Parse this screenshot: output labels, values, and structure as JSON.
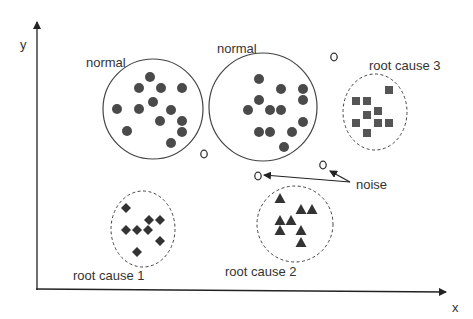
{
  "axes": {
    "x_label": "x",
    "y_label": "y",
    "color": "#222222"
  },
  "colors": {
    "point": "#4a4a4a",
    "outline": "#444444",
    "text": "#333333"
  },
  "clusters": [
    {
      "label": "normal",
      "shape": "circle",
      "boundary": "solid",
      "center": [
        153,
        109
      ],
      "r": [
        50,
        50
      ],
      "label_pos": [
        86,
        61
      ],
      "points": [
        [
          150,
          77
        ],
        [
          139,
          88
        ],
        [
          161,
          88
        ],
        [
          182,
          88
        ],
        [
          117,
          109
        ],
        [
          139,
          109
        ],
        [
          153,
          102
        ],
        [
          171,
          110
        ],
        [
          160,
          121
        ],
        [
          182,
          121
        ],
        [
          182,
          132
        ],
        [
          127,
          131
        ],
        [
          171,
          143
        ]
      ]
    },
    {
      "label": "normal",
      "shape": "circle",
      "boundary": "solid",
      "center": [
        263,
        107
      ],
      "r": [
        54,
        54
      ],
      "label_pos": [
        217,
        47
      ],
      "points": [
        [
          259,
          79
        ],
        [
          281,
          89
        ],
        [
          303,
          89
        ],
        [
          259,
          100
        ],
        [
          303,
          100
        ],
        [
          248,
          110
        ],
        [
          270,
          110
        ],
        [
          281,
          110
        ],
        [
          303,
          122
        ],
        [
          259,
          132
        ],
        [
          270,
          132
        ],
        [
          292,
          132
        ],
        [
          284,
          147
        ]
      ]
    },
    {
      "label": "root cause 3",
      "shape": "square",
      "boundary": "dashed",
      "center": [
        375,
        112
      ],
      "r": [
        32,
        38
      ],
      "label_pos": [
        369,
        58
      ],
      "points": [
        [
          389,
          90
        ],
        [
          356,
          101
        ],
        [
          367,
          101
        ],
        [
          367,
          115
        ],
        [
          378,
          111
        ],
        [
          356,
          123
        ],
        [
          378,
          123
        ],
        [
          389,
          123
        ],
        [
          367,
          133
        ]
      ]
    },
    {
      "label": "root cause 1",
      "shape": "diamond",
      "boundary": "dashed",
      "center": [
        143,
        229
      ],
      "r": [
        32,
        38
      ],
      "label_pos": [
        73,
        268
      ],
      "points": [
        [
          126,
          208
        ],
        [
          149,
          220
        ],
        [
          160,
          220
        ],
        [
          126,
          230
        ],
        [
          137,
          230
        ],
        [
          148,
          230
        ],
        [
          160,
          241
        ],
        [
          137,
          252
        ]
      ]
    },
    {
      "label": "root cause 2",
      "shape": "triangle",
      "boundary": "dashed",
      "center": [
        295,
        224
      ],
      "r": [
        38,
        38
      ],
      "label_pos": [
        225,
        265
      ],
      "points": [
        [
          280,
          199
        ],
        [
          301,
          210
        ],
        [
          312,
          210
        ],
        [
          280,
          221
        ],
        [
          291,
          221
        ],
        [
          280,
          231
        ],
        [
          301,
          231
        ],
        [
          301,
          243
        ]
      ]
    }
  ],
  "noise": {
    "label": "noise",
    "label_pos": [
      356,
      178
    ],
    "points": [
      [
        204,
        154
      ],
      [
        334,
        57
      ],
      [
        323,
        165
      ],
      [
        258,
        176
      ]
    ],
    "arrows": [
      {
        "from": [
          350,
          182
        ],
        "to": [
          264,
          175
        ]
      },
      {
        "from": [
          350,
          182
        ],
        "to": [
          330,
          171
        ]
      }
    ]
  }
}
